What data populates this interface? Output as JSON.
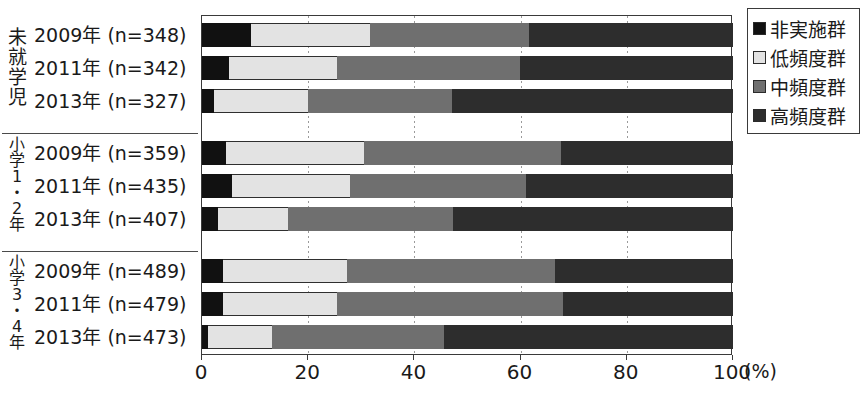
{
  "chart_data": {
    "type": "bar",
    "orientation": "horizontal",
    "stacked": true,
    "stack_total": 100,
    "title": "",
    "xlabel": "(%)",
    "ylabel": "",
    "xlim": [
      0,
      100
    ],
    "xticks": [
      0,
      20,
      40,
      60,
      80,
      100
    ],
    "xticklabels": [
      "0",
      "20",
      "40",
      "60",
      "80",
      "100"
    ],
    "grid": "vertical-dashed",
    "legend_position": "right-top",
    "series": [
      {
        "name": "非実施群",
        "color": "#111111"
      },
      {
        "name": "低頻度群",
        "color": "#e3e3e3"
      },
      {
        "name": "中頻度群",
        "color": "#6f6f6f"
      },
      {
        "name": "高頻度群",
        "color": "#2d2d2d"
      }
    ],
    "groups": [
      {
        "group_label": "未就学児",
        "group_label_lines": "未\n就\n学\n児",
        "rows": [
          {
            "category": "2009年 (n=348)",
            "values": [
              9.2,
              22.4,
              30.0,
              38.4
            ]
          },
          {
            "category": "2011年 (n=342)",
            "values": [
              5.1,
              20.3,
              34.4,
              40.2
            ]
          },
          {
            "category": "2013年 (n=327)",
            "values": [
              2.2,
              17.8,
              27.0,
              53.0
            ]
          }
        ]
      },
      {
        "group_label": "小学1・2年",
        "group_label_lines": "小\n学\n1\n・\n2\n年",
        "rows": [
          {
            "category": "2009年 (n=359)",
            "values": [
              4.5,
              26.0,
              37.1,
              32.4
            ]
          },
          {
            "category": "2011年 (n=435)",
            "values": [
              5.7,
              22.1,
              33.2,
              39.0
            ]
          },
          {
            "category": "2013年 (n=407)",
            "values": [
              3.0,
              13.2,
              31.1,
              52.7
            ]
          }
        ]
      },
      {
        "group_label": "小学3・4年",
        "group_label_lines": "小\n学\n3\n・\n4\n年",
        "rows": [
          {
            "category": "2009年 (n=489)",
            "values": [
              3.9,
              23.5,
              39.1,
              33.5
            ]
          },
          {
            "category": "2011年 (n=479)",
            "values": [
              4.0,
              21.5,
              42.5,
              32.0
            ]
          },
          {
            "category": "2013年 (n=473)",
            "values": [
              1.1,
              12.1,
              32.3,
              54.5
            ]
          }
        ]
      }
    ]
  },
  "axis": {
    "unit_label": "(%)",
    "tick_labels": [
      "0",
      "20",
      "40",
      "60",
      "80",
      "100"
    ]
  },
  "legend": {
    "items": [
      {
        "label": "非実施群",
        "swatch": "legend-swatch-black"
      },
      {
        "label": "低頻度群",
        "swatch": "legend-swatch-light"
      },
      {
        "label": "中頻度群",
        "swatch": "legend-swatch-medium"
      },
      {
        "label": "高頻度群",
        "swatch": "legend-swatch-dark"
      }
    ]
  }
}
